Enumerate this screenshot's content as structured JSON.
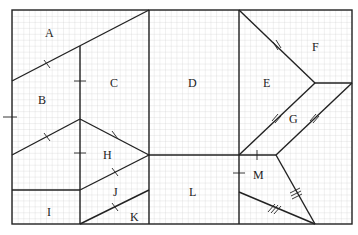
{
  "diagram": {
    "type": "tangram-style dissection on grid",
    "labels": [
      {
        "id": "A",
        "text": "A",
        "x": 50,
        "y": 37
      },
      {
        "id": "B",
        "text": "B",
        "x": 43,
        "y": 104
      },
      {
        "id": "C",
        "text": "C",
        "x": 115,
        "y": 87
      },
      {
        "id": "D",
        "text": "D",
        "x": 193,
        "y": 87
      },
      {
        "id": "E",
        "text": "E",
        "x": 268,
        "y": 87
      },
      {
        "id": "F",
        "text": "F",
        "x": 316,
        "y": 50
      },
      {
        "id": "G",
        "text": "G",
        "x": 295,
        "y": 122
      },
      {
        "id": "H",
        "text": "H",
        "x": 108,
        "y": 159
      },
      {
        "id": "I",
        "text": "I",
        "x": 50,
        "y": 216
      },
      {
        "id": "J",
        "text": "J",
        "x": 116,
        "y": 196
      },
      {
        "id": "K",
        "text": "K",
        "x": 134,
        "y": 221
      },
      {
        "id": "L",
        "text": "L",
        "x": 193,
        "y": 196
      },
      {
        "id": "M",
        "text": "M",
        "x": 258,
        "y": 179
      }
    ],
    "grid_color": "#c8c8c8",
    "line_color": "#222222"
  }
}
